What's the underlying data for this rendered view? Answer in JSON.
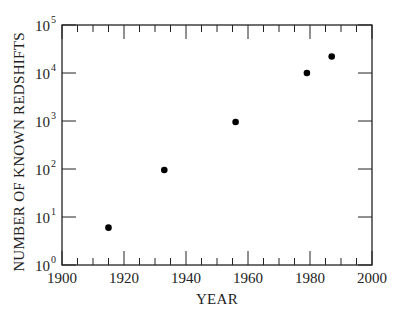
{
  "chart_data": {
    "type": "scatter",
    "title": "",
    "xlabel": "YEAR",
    "ylabel": "NUMBER OF KNOWN REDSHIFTS",
    "xlim": [
      1900,
      2000
    ],
    "ylim": [
      1,
      100000
    ],
    "yscale": "log",
    "grid": false,
    "legend": null,
    "x_ticks": [
      1900,
      1920,
      1940,
      1960,
      1980,
      2000
    ],
    "x_tick_labels": [
      "1900",
      "1920",
      "1940",
      "1960",
      "1980",
      "2000"
    ],
    "y_ticks": [
      1,
      10,
      100,
      1000,
      10000,
      100000
    ],
    "y_tick_labels": [
      {
        "base": "10",
        "exp": "0"
      },
      {
        "base": "10",
        "exp": "1"
      },
      {
        "base": "10",
        "exp": "2"
      },
      {
        "base": "10",
        "exp": "3"
      },
      {
        "base": "10",
        "exp": "4"
      },
      {
        "base": "10",
        "exp": "5"
      }
    ],
    "series": [
      {
        "name": "Known redshifts",
        "x": [
          1915,
          1933,
          1956,
          1979,
          1987
        ],
        "y": [
          6,
          95,
          950,
          10000,
          22000
        ]
      }
    ],
    "colors": {
      "axis": "#222222",
      "marker": "#000000",
      "background": "#ffffff"
    }
  }
}
